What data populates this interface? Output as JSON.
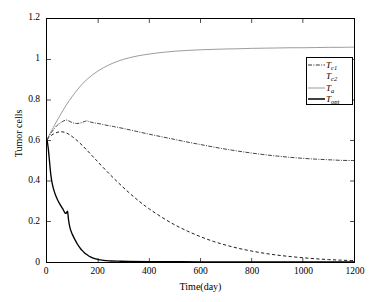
{
  "chart_data": {
    "type": "line",
    "title": "",
    "xlabel": "Time(day)",
    "ylabel": "Tumor cells",
    "xlim": [
      0,
      1200
    ],
    "ylim": [
      0,
      1.2
    ],
    "xticks": [
      0,
      200,
      400,
      600,
      800,
      1000,
      1200
    ],
    "xtick_labels": [
      "0",
      "200",
      "400",
      "600",
      "800",
      "1000",
      "1200"
    ],
    "yticks": [
      0,
      0.2,
      0.4,
      0.6,
      0.8,
      1,
      1.2
    ],
    "ytick_labels": [
      "0",
      "0.2",
      "0.4",
      "0.6",
      "0.8",
      "1",
      "1.2"
    ],
    "grid": false,
    "legend_position": "upper right",
    "series": [
      {
        "name": "T_c1",
        "label": "T",
        "sub": "c1",
        "style": "dashdot",
        "color": "#000000",
        "x": [
          0,
          20,
          40,
          60,
          75,
          85,
          100,
          115,
          130,
          145,
          155,
          165,
          180,
          200,
          230,
          260,
          300,
          350,
          400,
          450,
          500,
          550,
          600,
          650,
          700,
          750,
          800,
          850,
          900,
          950,
          1000,
          1050,
          1100,
          1150,
          1200
        ],
        "y": [
          0.605,
          0.645,
          0.675,
          0.693,
          0.701,
          0.697,
          0.688,
          0.684,
          0.686,
          0.693,
          0.697,
          0.693,
          0.688,
          0.684,
          0.676,
          0.669,
          0.659,
          0.645,
          0.631,
          0.618,
          0.605,
          0.592,
          0.58,
          0.568,
          0.557,
          0.547,
          0.538,
          0.53,
          0.523,
          0.517,
          0.512,
          0.508,
          0.505,
          0.502,
          0.501
        ]
      },
      {
        "name": "T_c2",
        "label": "T",
        "sub": "c2",
        "style": "dashed",
        "color": "#000000",
        "x": [
          0,
          20,
          40,
          55,
          70,
          85,
          100,
          120,
          140,
          160,
          180,
          200,
          240,
          280,
          320,
          360,
          400,
          450,
          500,
          550,
          600,
          650,
          700,
          750,
          800,
          850,
          900,
          950,
          1000,
          1050,
          1100,
          1150,
          1200
        ],
        "y": [
          0.605,
          0.628,
          0.64,
          0.643,
          0.64,
          0.631,
          0.618,
          0.597,
          0.573,
          0.547,
          0.52,
          0.493,
          0.44,
          0.39,
          0.343,
          0.3,
          0.262,
          0.22,
          0.183,
          0.152,
          0.125,
          0.102,
          0.083,
          0.067,
          0.054,
          0.043,
          0.034,
          0.027,
          0.021,
          0.016,
          0.012,
          0.009,
          0.007
        ]
      },
      {
        "name": "T_a",
        "label": "T",
        "sub": "a",
        "style": "solid-thin",
        "color": "#000000",
        "x": [
          0,
          25,
          50,
          75,
          100,
          130,
          160,
          200,
          240,
          280,
          320,
          360,
          400,
          450,
          500,
          550,
          600,
          650,
          700,
          750,
          800,
          850,
          900,
          950,
          1000,
          1050,
          1100,
          1150,
          1200
        ],
        "y": [
          0.605,
          0.665,
          0.722,
          0.774,
          0.82,
          0.868,
          0.906,
          0.944,
          0.972,
          0.993,
          1.008,
          1.019,
          1.027,
          1.035,
          1.041,
          1.045,
          1.048,
          1.05,
          1.052,
          1.053,
          1.055,
          1.056,
          1.057,
          1.058,
          1.058,
          1.059,
          1.06,
          1.06,
          1.061
        ]
      },
      {
        "name": "T_opt",
        "label": "T",
        "sub": "opt",
        "style": "solid-thick",
        "color": "#000000",
        "x": [
          0,
          5,
          10,
          15,
          20,
          28,
          36,
          44,
          52,
          60,
          66,
          70,
          74,
          78,
          80,
          82,
          84,
          88,
          92,
          96,
          100,
          106,
          112,
          118,
          124,
          130,
          138,
          146,
          154,
          162,
          170,
          180,
          190,
          200,
          215,
          230,
          250,
          280,
          320,
          400,
          500,
          600,
          800,
          1000,
          1200
        ],
        "y": [
          0.605,
          0.56,
          0.495,
          0.43,
          0.39,
          0.35,
          0.322,
          0.3,
          0.282,
          0.266,
          0.252,
          0.243,
          0.24,
          0.248,
          0.25,
          0.236,
          0.21,
          0.18,
          0.16,
          0.146,
          0.134,
          0.118,
          0.104,
          0.09,
          0.078,
          0.068,
          0.056,
          0.046,
          0.038,
          0.031,
          0.025,
          0.019,
          0.015,
          0.012,
          0.009,
          0.007,
          0.005,
          0.004,
          0.003,
          0.002,
          0.002,
          0.001,
          0.001,
          0.001,
          0.001
        ]
      }
    ]
  },
  "axes": {
    "xlabel": "Time(day)",
    "ylabel": "Tumor cells"
  },
  "legend": {
    "items": [
      {
        "label": "T",
        "sub": "c1"
      },
      {
        "label": "T",
        "sub": "c2"
      },
      {
        "label": "T",
        "sub": "a"
      },
      {
        "label": "T",
        "sub": "opt"
      }
    ]
  }
}
